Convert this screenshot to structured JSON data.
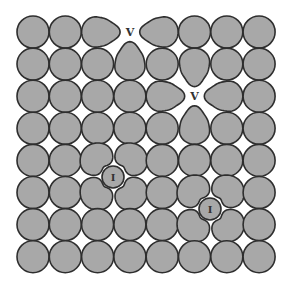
{
  "diagram": {
    "title": "",
    "grid": {
      "columns": 8,
      "rows": 8,
      "origin_x": 33,
      "origin_y": 32,
      "spacing_x": 32.3,
      "spacing_y": 32.1,
      "atom_radius": 16
    },
    "colors": {
      "atom_fill": "#a8a8a8",
      "atom_stroke": "#2e2e2e",
      "background": "#ffffff",
      "label": "#333333"
    },
    "vacancies": [
      {
        "label": "V",
        "col": 3,
        "row": 0
      },
      {
        "label": "V",
        "col": 5,
        "row": 2
      }
    ],
    "interstitials": [
      {
        "label": "I",
        "x": 113,
        "y": 177,
        "r": 11
      },
      {
        "label": "I",
        "x": 210,
        "y": 209,
        "r": 11
      }
    ]
  }
}
